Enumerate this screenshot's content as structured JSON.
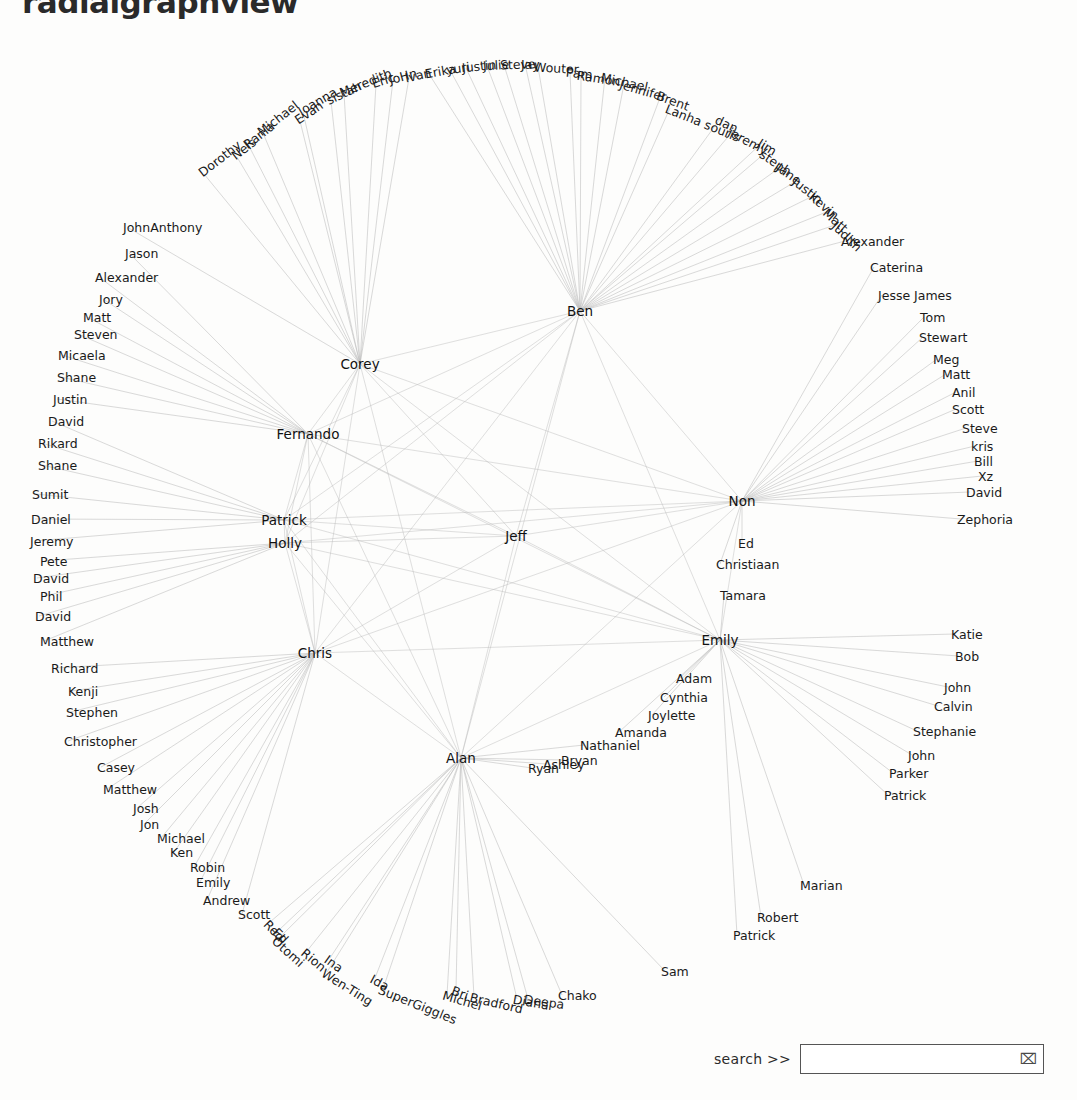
{
  "page": {
    "title": "radialgraphview",
    "background_color": "#fdfdfc",
    "text_color": "#1a1a1a",
    "edge_color": "#b9b9b9"
  },
  "search": {
    "label": "search >>",
    "value": "",
    "placeholder": "",
    "glyph": "⌧",
    "glyph_name": "hourglass-icon"
  },
  "graph": {
    "type": "radial-node-link",
    "center": {
      "x": 520,
      "y": 540
    },
    "hubs": [
      {
        "id": "Ben",
        "label": "Ben",
        "x": 580,
        "y": 311,
        "anchor": "c"
      },
      {
        "id": "Corey",
        "label": "Corey",
        "x": 360,
        "y": 364,
        "anchor": "c"
      },
      {
        "id": "Fernando",
        "label": "Fernando",
        "x": 308,
        "y": 434,
        "anchor": "c"
      },
      {
        "id": "Jeff",
        "label": "Jeff",
        "x": 516,
        "y": 536,
        "anchor": "c"
      },
      {
        "id": "Patrick",
        "label": "Patrick",
        "x": 284,
        "y": 520,
        "anchor": "c"
      },
      {
        "id": "Holly",
        "label": "Holly",
        "x": 285,
        "y": 543,
        "anchor": "c"
      },
      {
        "id": "Non",
        "label": "Non",
        "x": 742,
        "y": 501,
        "anchor": "c"
      },
      {
        "id": "Chris",
        "label": "Chris",
        "x": 315,
        "y": 653,
        "anchor": "c"
      },
      {
        "id": "Emily",
        "label": "Emily",
        "x": 720,
        "y": 640,
        "anchor": "c"
      },
      {
        "id": "Alan",
        "label": "Alan",
        "x": 461,
        "y": 758,
        "anchor": "c"
      }
    ],
    "leaves": [
      {
        "label": "Dorothy",
        "x": 200,
        "y": 174,
        "anchor": "r",
        "rot": -38
      },
      {
        "label": "Nels",
        "x": 233,
        "y": 157,
        "anchor": "r",
        "rot": -38
      },
      {
        "label": "Rania",
        "x": 245,
        "y": 146,
        "anchor": "r",
        "rot": -38
      },
      {
        "label": "Michael",
        "x": 259,
        "y": 133,
        "anchor": "r",
        "rot": -38
      },
      {
        "label": "Evan",
        "x": 296,
        "y": 121,
        "anchor": "r",
        "rot": -34
      },
      {
        "label": "Joanna",
        "x": 299,
        "y": 112,
        "anchor": "r",
        "rot": -30
      },
      {
        "label": "sistah",
        "x": 327,
        "y": 101,
        "anchor": "r",
        "rot": -25
      },
      {
        "label": "Meredith",
        "x": 340,
        "y": 93,
        "anchor": "r",
        "rot": -22
      },
      {
        "label": "Eric",
        "x": 372,
        "y": 84,
        "anchor": "r",
        "rot": -18
      },
      {
        "label": "JoHn",
        "x": 389,
        "y": 80,
        "anchor": "r",
        "rot": -15
      },
      {
        "label": "Ivan",
        "x": 405,
        "y": 78,
        "anchor": "r",
        "rot": -12
      },
      {
        "label": "Erika",
        "x": 425,
        "y": 74,
        "anchor": "r",
        "rot": -10
      },
      {
        "label": "yuri",
        "x": 446,
        "y": 70,
        "anchor": "r",
        "rot": -8
      },
      {
        "label": "Justin",
        "x": 462,
        "y": 68,
        "anchor": "r",
        "rot": -6
      },
      {
        "label": "Julie",
        "x": 483,
        "y": 66,
        "anchor": "r",
        "rot": -4
      },
      {
        "label": "Steve",
        "x": 500,
        "y": 65,
        "anchor": "r",
        "rot": -2
      },
      {
        "label": "Jay",
        "x": 521,
        "y": 64,
        "anchor": "r",
        "rot": 0
      },
      {
        "label": "Wouter",
        "x": 534,
        "y": 67,
        "anchor": "r",
        "rot": 3
      },
      {
        "label": "Pam",
        "x": 566,
        "y": 72,
        "anchor": "r",
        "rot": 6
      },
      {
        "label": "Ramon",
        "x": 577,
        "y": 75,
        "anchor": "r",
        "rot": 9
      },
      {
        "label": "Michael",
        "x": 601,
        "y": 77,
        "anchor": "r",
        "rot": 12
      },
      {
        "label": "Jennifer",
        "x": 620,
        "y": 84,
        "anchor": "r",
        "rot": 16
      },
      {
        "label": "Brent",
        "x": 657,
        "y": 95,
        "anchor": "r",
        "rot": 20
      },
      {
        "label": "Lanha souris",
        "x": 666,
        "y": 108,
        "anchor": "r",
        "rot": 22
      },
      {
        "label": "dan",
        "x": 716,
        "y": 119,
        "anchor": "r",
        "rot": 25
      },
      {
        "label": "jeremy",
        "x": 729,
        "y": 131,
        "anchor": "r",
        "rot": 28
      },
      {
        "label": "Jim",
        "x": 759,
        "y": 142,
        "anchor": "r",
        "rot": 32
      },
      {
        "label": "steph",
        "x": 761,
        "y": 153,
        "anchor": "r",
        "rot": 34
      },
      {
        "label": "Jane",
        "x": 778,
        "y": 166,
        "anchor": "r",
        "rot": 36
      },
      {
        "label": "Justin",
        "x": 794,
        "y": 180,
        "anchor": "r",
        "rot": 38
      },
      {
        "label": "Kevin",
        "x": 811,
        "y": 195,
        "anchor": "r",
        "rot": 40
      },
      {
        "label": "Matt",
        "x": 825,
        "y": 211,
        "anchor": "r",
        "rot": 42
      },
      {
        "label": "Judith",
        "x": 834,
        "y": 224,
        "anchor": "r",
        "rot": 44
      },
      {
        "label": "Alexander",
        "x": 841,
        "y": 241,
        "anchor": "r",
        "rot": 0
      },
      {
        "label": "Caterina",
        "x": 870,
        "y": 267,
        "anchor": "r",
        "rot": 0
      },
      {
        "label": "Jesse James",
        "x": 878,
        "y": 295,
        "anchor": "r",
        "rot": 0
      },
      {
        "label": "Tom",
        "x": 920,
        "y": 317,
        "anchor": "r",
        "rot": 0
      },
      {
        "label": "Stewart",
        "x": 919,
        "y": 337,
        "anchor": "r",
        "rot": 0
      },
      {
        "label": "Meg",
        "x": 933,
        "y": 359,
        "anchor": "r",
        "rot": 0
      },
      {
        "label": "Matt",
        "x": 942,
        "y": 374,
        "anchor": "r",
        "rot": 0
      },
      {
        "label": "Anil",
        "x": 952,
        "y": 392,
        "anchor": "r",
        "rot": 0
      },
      {
        "label": "Scott",
        "x": 952,
        "y": 409,
        "anchor": "r",
        "rot": 0
      },
      {
        "label": "Steve",
        "x": 962,
        "y": 428,
        "anchor": "r",
        "rot": 0
      },
      {
        "label": "kris",
        "x": 971,
        "y": 446,
        "anchor": "r",
        "rot": 0
      },
      {
        "label": "Bill",
        "x": 974,
        "y": 461,
        "anchor": "r",
        "rot": 0
      },
      {
        "label": "Xz",
        "x": 978,
        "y": 476,
        "anchor": "r",
        "rot": 0
      },
      {
        "label": "David",
        "x": 966,
        "y": 492,
        "anchor": "r",
        "rot": 0
      },
      {
        "label": "Zephoria",
        "x": 957,
        "y": 519,
        "anchor": "r",
        "rot": 0
      },
      {
        "label": "Ed",
        "x": 738,
        "y": 543,
        "anchor": "r",
        "rot": 0
      },
      {
        "label": "Christiaan",
        "x": 716,
        "y": 564,
        "anchor": "r",
        "rot": 0
      },
      {
        "label": "Tamara",
        "x": 720,
        "y": 595,
        "anchor": "r",
        "rot": 0
      },
      {
        "label": "Katie",
        "x": 951,
        "y": 634,
        "anchor": "r",
        "rot": 0
      },
      {
        "label": "Bob",
        "x": 955,
        "y": 656,
        "anchor": "r",
        "rot": 0
      },
      {
        "label": "Adam",
        "x": 676,
        "y": 678,
        "anchor": "r",
        "rot": 0
      },
      {
        "label": "Cynthia",
        "x": 660,
        "y": 697,
        "anchor": "r",
        "rot": 0
      },
      {
        "label": "Joylette",
        "x": 648,
        "y": 715,
        "anchor": "r",
        "rot": 0
      },
      {
        "label": "Amanda",
        "x": 615,
        "y": 732,
        "anchor": "r",
        "rot": 0
      },
      {
        "label": "Nathaniel",
        "x": 580,
        "y": 745,
        "anchor": "r",
        "rot": 0
      },
      {
        "label": "Bryan",
        "x": 561,
        "y": 760,
        "anchor": "r",
        "rot": 0
      },
      {
        "label": "Ashley",
        "x": 543,
        "y": 764,
        "anchor": "r",
        "rot": 0
      },
      {
        "label": "Ryan",
        "x": 528,
        "y": 768,
        "anchor": "r",
        "rot": 0
      },
      {
        "label": "John",
        "x": 944,
        "y": 687,
        "anchor": "r",
        "rot": 0
      },
      {
        "label": "Calvin",
        "x": 934,
        "y": 706,
        "anchor": "r",
        "rot": 0
      },
      {
        "label": "Stephanie",
        "x": 913,
        "y": 731,
        "anchor": "r",
        "rot": 0
      },
      {
        "label": "John",
        "x": 908,
        "y": 755,
        "anchor": "r",
        "rot": 0
      },
      {
        "label": "Parker",
        "x": 889,
        "y": 773,
        "anchor": "r",
        "rot": 0
      },
      {
        "label": "Patrick",
        "x": 884,
        "y": 795,
        "anchor": "r",
        "rot": 0
      },
      {
        "label": "Marian",
        "x": 800,
        "y": 885,
        "anchor": "r",
        "rot": 0
      },
      {
        "label": "Robert",
        "x": 757,
        "y": 917,
        "anchor": "r",
        "rot": 0
      },
      {
        "label": "Patrick",
        "x": 733,
        "y": 935,
        "anchor": "r",
        "rot": 0
      },
      {
        "label": "Sam",
        "x": 661,
        "y": 971,
        "anchor": "r",
        "rot": 0
      },
      {
        "label": "Chako",
        "x": 558,
        "y": 995,
        "anchor": "r",
        "rot": 0
      },
      {
        "label": "Deepa",
        "x": 524,
        "y": 999,
        "anchor": "r",
        "rot": 8
      },
      {
        "label": "Diana",
        "x": 513,
        "y": 999,
        "anchor": "r",
        "rot": 10
      },
      {
        "label": "Bradford",
        "x": 470,
        "y": 997,
        "anchor": "r",
        "rot": 13
      },
      {
        "label": "Michel",
        "x": 443,
        "y": 995,
        "anchor": "r",
        "rot": 16
      },
      {
        "label": "Bri",
        "x": 452,
        "y": 990,
        "anchor": "r",
        "rot": 20
      },
      {
        "label": "SuperGiggles",
        "x": 379,
        "y": 989,
        "anchor": "r",
        "rot": 22
      },
      {
        "label": "Ida",
        "x": 371,
        "y": 978,
        "anchor": "r",
        "rot": 28
      },
      {
        "label": "Wen-Ting",
        "x": 323,
        "y": 972,
        "anchor": "r",
        "rot": 32
      },
      {
        "label": "Ina",
        "x": 326,
        "y": 958,
        "anchor": "r",
        "rot": 36
      },
      {
        "label": "Rion",
        "x": 303,
        "y": 951,
        "anchor": "r",
        "rot": 40
      },
      {
        "label": "Otomi",
        "x": 274,
        "y": 939,
        "anchor": "r",
        "rot": 42
      },
      {
        "label": "Ed",
        "x": 275,
        "y": 930,
        "anchor": "r",
        "rot": 45
      },
      {
        "label": "Red",
        "x": 266,
        "y": 922,
        "anchor": "r",
        "rot": 46
      },
      {
        "label": "Scott",
        "x": 238,
        "y": 914,
        "anchor": "r",
        "rot": 0
      },
      {
        "label": "Andrew",
        "x": 203,
        "y": 900,
        "anchor": "r",
        "rot": 0
      },
      {
        "label": "Emily",
        "x": 196,
        "y": 882,
        "anchor": "r",
        "rot": 0
      },
      {
        "label": "Robin",
        "x": 190,
        "y": 867,
        "anchor": "r",
        "rot": 0
      },
      {
        "label": "Ken",
        "x": 170,
        "y": 852,
        "anchor": "r",
        "rot": 0
      },
      {
        "label": "Michael",
        "x": 157,
        "y": 838,
        "anchor": "r",
        "rot": 0
      },
      {
        "label": "Jon",
        "x": 140,
        "y": 824,
        "anchor": "r",
        "rot": 0
      },
      {
        "label": "Josh",
        "x": 133,
        "y": 808,
        "anchor": "r",
        "rot": 0
      },
      {
        "label": "Matthew",
        "x": 103,
        "y": 789,
        "anchor": "r",
        "rot": 0
      },
      {
        "label": "Casey",
        "x": 97,
        "y": 767,
        "anchor": "r",
        "rot": 0
      },
      {
        "label": "Christopher",
        "x": 64,
        "y": 741,
        "anchor": "r",
        "rot": 0
      },
      {
        "label": "Stephen",
        "x": 66,
        "y": 712,
        "anchor": "r",
        "rot": 0
      },
      {
        "label": "Kenji",
        "x": 68,
        "y": 691,
        "anchor": "r",
        "rot": 0
      },
      {
        "label": "Richard",
        "x": 51,
        "y": 668,
        "anchor": "r",
        "rot": 0
      },
      {
        "label": "Matthew",
        "x": 40,
        "y": 641,
        "anchor": "r",
        "rot": 0
      },
      {
        "label": "David",
        "x": 35,
        "y": 616,
        "anchor": "r",
        "rot": 0
      },
      {
        "label": "Phil",
        "x": 40,
        "y": 596,
        "anchor": "r",
        "rot": 0
      },
      {
        "label": "David",
        "x": 33,
        "y": 578,
        "anchor": "r",
        "rot": 0
      },
      {
        "label": "Pete",
        "x": 40,
        "y": 561,
        "anchor": "r",
        "rot": 0
      },
      {
        "label": "Jeremy",
        "x": 30,
        "y": 541,
        "anchor": "r",
        "rot": 0
      },
      {
        "label": "Daniel",
        "x": 31,
        "y": 519,
        "anchor": "r",
        "rot": 0
      },
      {
        "label": "Sumit",
        "x": 32,
        "y": 494,
        "anchor": "r",
        "rot": 0
      },
      {
        "label": "Shane",
        "x": 38,
        "y": 465,
        "anchor": "r",
        "rot": 0
      },
      {
        "label": "Rikard",
        "x": 38,
        "y": 443,
        "anchor": "r",
        "rot": 0
      },
      {
        "label": "David",
        "x": 48,
        "y": 421,
        "anchor": "r",
        "rot": 0
      },
      {
        "label": "Justin",
        "x": 53,
        "y": 399,
        "anchor": "r",
        "rot": 0
      },
      {
        "label": "Shane",
        "x": 57,
        "y": 377,
        "anchor": "r",
        "rot": 0
      },
      {
        "label": "Micaela",
        "x": 58,
        "y": 355,
        "anchor": "r",
        "rot": 0
      },
      {
        "label": "Steven",
        "x": 74,
        "y": 334,
        "anchor": "r",
        "rot": 0
      },
      {
        "label": "Matt",
        "x": 83,
        "y": 317,
        "anchor": "r",
        "rot": 0
      },
      {
        "label": "Jory",
        "x": 99,
        "y": 299,
        "anchor": "r",
        "rot": 0
      },
      {
        "label": "Alexander",
        "x": 95,
        "y": 277,
        "anchor": "r",
        "rot": 0
      },
      {
        "label": "Jason",
        "x": 125,
        "y": 253,
        "anchor": "r",
        "rot": 0
      },
      {
        "label": "JohnAnthony",
        "x": 123,
        "y": 227,
        "anchor": "r",
        "rot": 0
      }
    ]
  }
}
